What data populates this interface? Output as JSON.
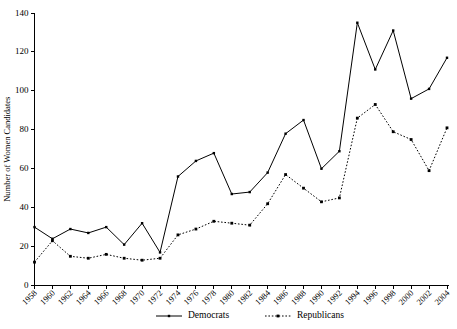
{
  "chart_data": {
    "type": "line",
    "title": "",
    "subtitle": "",
    "xlabel": "",
    "ylabel": "Number of Women Candidates",
    "ylim": [
      0,
      140
    ],
    "yticks": [
      0,
      20,
      40,
      60,
      80,
      100,
      120,
      140
    ],
    "grid": false,
    "legend_position": "bottom",
    "categories": [
      "1958",
      "1960",
      "1962",
      "1964",
      "1966",
      "1968",
      "1970",
      "1972",
      "1974",
      "1976",
      "1978",
      "1980",
      "1982",
      "1984",
      "1986",
      "1988",
      "1990",
      "1992",
      "1994",
      "1996",
      "1998",
      "2000",
      "2002",
      "2004"
    ],
    "series": [
      {
        "name": "Democrats",
        "style": "solid",
        "marker": "square",
        "color": "#000000",
        "values": [
          30,
          24,
          29,
          27,
          30,
          21,
          32,
          17,
          56,
          64,
          68,
          47,
          48,
          58,
          78,
          85,
          60,
          69,
          135,
          111,
          131,
          96,
          101,
          117
        ]
      },
      {
        "name": "Republicans",
        "style": "dotted",
        "marker": "square",
        "color": "#000000",
        "values": [
          12,
          23,
          15,
          14,
          16,
          14,
          13,
          14,
          26,
          29,
          33,
          32,
          31,
          42,
          57,
          50,
          43,
          45,
          86,
          93,
          79,
          75,
          59,
          81
        ]
      }
    ]
  },
  "legend": {
    "items": [
      {
        "label": "Democrats"
      },
      {
        "label": "Republicans"
      }
    ]
  }
}
